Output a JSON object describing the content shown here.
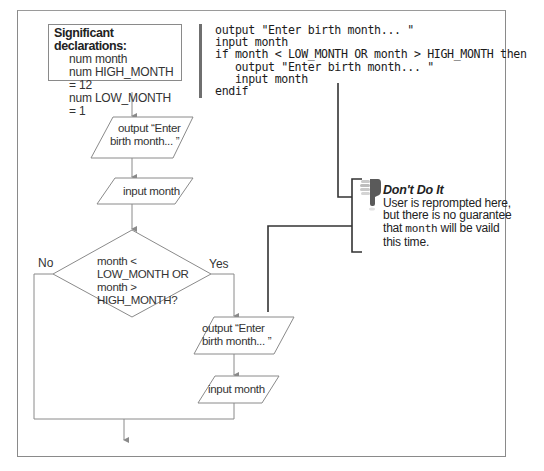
{
  "declarations": {
    "title": "Significant declarations:",
    "lines": [
      "num month",
      "num HIGH_MONTH = 12",
      "num LOW_MONTH = 1"
    ]
  },
  "pseudocode": {
    "lines": [
      "output \"Enter birth month... \"",
      "input month",
      "if month < LOW_MONTH OR month > HIGH_MONTH then",
      "   output \"Enter birth month... \"",
      "   input month",
      "endif"
    ]
  },
  "flowchart": {
    "output1": [
      "output “Enter",
      "birth month... ”"
    ],
    "input1": "input month",
    "decision": [
      "month <",
      "LOW_MONTH OR",
      "month >",
      "HIGH_MONTH?"
    ],
    "no_label": "No",
    "yes_label": "Yes",
    "output2": [
      "output “Enter",
      "birth month... ”"
    ],
    "input2": "input month"
  },
  "callout": {
    "icon": "thumbs-down-icon",
    "title": "Don't Do It",
    "text_before": "User is reprompted here, but there is no guarantee that ",
    "code_word": "month",
    "text_after": " will be vaild this time."
  },
  "colors": {
    "line": "#8a8a8a",
    "connector": "#333333",
    "frame": "#8a8a8a"
  }
}
